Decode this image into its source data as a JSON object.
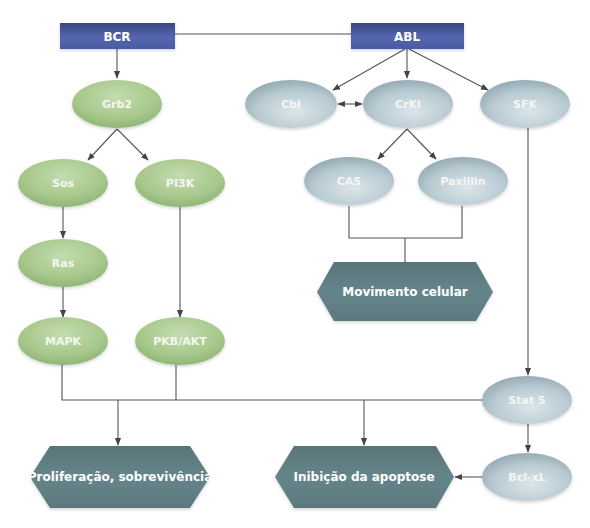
{
  "diagram": {
    "colors": {
      "box_fill": "#4f5fa8",
      "box_fill_dark": "#3a4585",
      "green_node": "#a6c78a",
      "green_node_light": "#c4dcb0",
      "blue_node": "#b3c4cc",
      "blue_node_light": "#d6e1e6",
      "outcome_hex": "#5f7d82",
      "line": "#555555",
      "background": "#ffffff"
    },
    "boxes": [
      {
        "id": "bcr",
        "label": "BCR"
      },
      {
        "id": "abl",
        "label": "ABL"
      }
    ],
    "green_nodes": [
      {
        "id": "grb2",
        "label": "Grb2"
      },
      {
        "id": "sos",
        "label": "Sos"
      },
      {
        "id": "pi3k",
        "label": "PI3K"
      },
      {
        "id": "ras",
        "label": "Ras"
      },
      {
        "id": "mapk",
        "label": "MAPK"
      },
      {
        "id": "pkb_akt",
        "label": "PKB/AKT"
      }
    ],
    "blue_nodes": [
      {
        "id": "cbl",
        "label": "Cbl"
      },
      {
        "id": "crkl",
        "label": "CrKl"
      },
      {
        "id": "sfk",
        "label": "SFK"
      },
      {
        "id": "cas",
        "label": "CAS"
      },
      {
        "id": "paxillin",
        "label": "Paxillin"
      },
      {
        "id": "stat5",
        "label": "Stat 5"
      },
      {
        "id": "bcl_xl",
        "label": "Bcl-xL"
      }
    ],
    "outcomes": [
      {
        "id": "movimento",
        "label": "Movimento celular"
      },
      {
        "id": "proliferacao",
        "label": "Proliferação, sobrevivência"
      },
      {
        "id": "inibicao",
        "label": "Inibição da apoptose"
      }
    ],
    "edges": [
      {
        "from": "BCR",
        "to": "ABL",
        "type": "line"
      },
      {
        "from": "BCR",
        "to": "Grb2",
        "type": "arrow"
      },
      {
        "from": "Grb2",
        "to": "Sos",
        "type": "arrow"
      },
      {
        "from": "Grb2",
        "to": "PI3K",
        "type": "arrow"
      },
      {
        "from": "Sos",
        "to": "Ras",
        "type": "arrow"
      },
      {
        "from": "Ras",
        "to": "MAPK",
        "type": "arrow"
      },
      {
        "from": "PI3K",
        "to": "PKB/AKT",
        "type": "arrow"
      },
      {
        "from": "ABL",
        "to": "Cbl",
        "type": "arrow"
      },
      {
        "from": "ABL",
        "to": "CrKl",
        "type": "arrow"
      },
      {
        "from": "ABL",
        "to": "SFK",
        "type": "arrow"
      },
      {
        "from": "Cbl",
        "to": "CrKl",
        "type": "bidirectional"
      },
      {
        "from": "CrKl",
        "to": "CAS",
        "type": "arrow"
      },
      {
        "from": "CrKl",
        "to": "Paxillin",
        "type": "arrow"
      },
      {
        "from": "CAS+Paxillin",
        "to": "Movimento celular",
        "type": "merge"
      },
      {
        "from": "SFK",
        "to": "Stat 5",
        "type": "arrow"
      },
      {
        "from": "MAPK+PKB/AKT+Stat 5",
        "to": "Proliferação, sobrevivência",
        "type": "bus-arrow"
      },
      {
        "from": "MAPK+PKB/AKT+Stat 5",
        "to": "Inibição da apoptose",
        "type": "bus-arrow"
      },
      {
        "from": "Stat 5",
        "to": "Bcl-xL",
        "type": "arrow"
      },
      {
        "from": "Bcl-xL",
        "to": "Inibição da apoptose",
        "type": "arrow"
      }
    ]
  }
}
